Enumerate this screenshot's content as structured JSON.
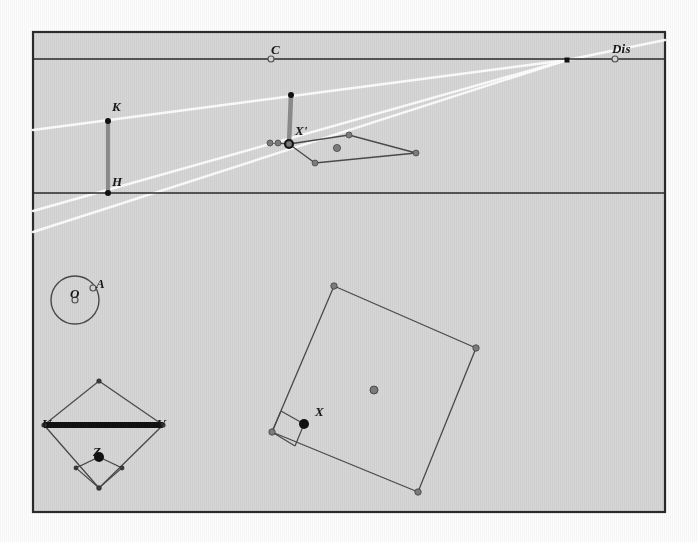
{
  "figure": {
    "kind": "perspective-geometry-construction",
    "background_color": "#d6d6d6",
    "outside_color": "#fdfdfd",
    "frame_color": "#2b2b2b",
    "line_color": "#4a4a4a",
    "construction_line_color": "#ffffff",
    "point_fill_color": "#7d7d7d",
    "solid_point_color": "#111111",
    "bar_color": "#8c8c8c",
    "frame": {
      "x": 33,
      "y": 32,
      "width": 632,
      "height": 480
    },
    "horizon_line": {
      "x1": 33,
      "y1": 59,
      "x2": 665,
      "y2": 59
    },
    "ground_line": {
      "x1": 33,
      "y1": 193,
      "x2": 665,
      "y2": 193
    }
  },
  "labels": [
    {
      "id": "label-C",
      "text": "C",
      "x": 271,
      "y": 43
    },
    {
      "id": "label-Dis",
      "text": "Dis",
      "x": 612,
      "y": 42
    },
    {
      "id": "label-K",
      "text": "K",
      "x": 112,
      "y": 100
    },
    {
      "id": "label-H",
      "text": "H",
      "x": 112,
      "y": 175
    },
    {
      "id": "label-Xp",
      "text": "X'",
      "x": 295,
      "y": 124
    },
    {
      "id": "label-O",
      "text": "O",
      "x": 70,
      "y": 287
    },
    {
      "id": "label-A",
      "text": "A",
      "x": 96,
      "y": 277
    },
    {
      "id": "label-U",
      "text": "U",
      "x": 42,
      "y": 417
    },
    {
      "id": "label-V",
      "text": "V",
      "x": 157,
      "y": 417
    },
    {
      "id": "label-Z",
      "text": "Z",
      "x": 93,
      "y": 445
    },
    {
      "id": "label-X",
      "text": "X",
      "x": 315,
      "y": 405
    }
  ],
  "points": {
    "C": {
      "x": 271,
      "y": 59,
      "style": "hollow"
    },
    "Dis": {
      "x": 615,
      "y": 59,
      "style": "hollow"
    },
    "VP": {
      "x": 567,
      "y": 60,
      "style": "square"
    },
    "K": {
      "x": 108,
      "y": 121,
      "style": "solid-small"
    },
    "H": {
      "x": 108,
      "y": 193,
      "style": "solid-small"
    },
    "Xp": {
      "x": 289,
      "y": 144,
      "style": "solid"
    },
    "Xp_top": {
      "x": 291,
      "y": 95,
      "style": "solid-small"
    },
    "O": {
      "x": 75,
      "y": 300,
      "style": "hollow"
    },
    "A": {
      "x": 93,
      "y": 288,
      "style": "hollow"
    },
    "Z": {
      "x": 99,
      "y": 457,
      "style": "solid"
    },
    "X": {
      "x": 304,
      "y": 424,
      "style": "solid"
    }
  },
  "upper_quad": {
    "name": "perspective-foreshortened-square",
    "vertices": [
      {
        "x": 289,
        "y": 144
      },
      {
        "x": 349,
        "y": 135
      },
      {
        "x": 416,
        "y": 153
      },
      {
        "x": 315,
        "y": 163
      }
    ],
    "center": {
      "x": 337,
      "y": 148
    },
    "extra_points": [
      {
        "x": 270,
        "y": 143
      },
      {
        "x": 278,
        "y": 143
      }
    ]
  },
  "lower_quad": {
    "name": "large-tilted-square",
    "vertices": [
      {
        "x": 334,
        "y": 286
      },
      {
        "x": 476,
        "y": 348
      },
      {
        "x": 418,
        "y": 492
      },
      {
        "x": 272,
        "y": 432
      }
    ],
    "center": {
      "x": 374,
      "y": 390
    },
    "right_angle_marker": [
      {
        "x": 281,
        "y": 411
      },
      {
        "x": 304,
        "y": 424
      },
      {
        "x": 295,
        "y": 446
      }
    ]
  },
  "diamond": {
    "name": "square-root-construction-diamond",
    "vertices": [
      {
        "x": 99,
        "y": 381
      },
      {
        "x": 163,
        "y": 425
      },
      {
        "x": 99,
        "y": 488
      },
      {
        "x": 44,
        "y": 425
      }
    ],
    "bar": {
      "x1": 44,
      "y1": 425,
      "x2": 163,
      "y2": 425
    },
    "inner_diamond": [
      {
        "x": 99,
        "y": 457
      },
      {
        "x": 122,
        "y": 468
      },
      {
        "x": 99,
        "y": 488
      },
      {
        "x": 76,
        "y": 468
      }
    ]
  },
  "circle": {
    "name": "reference-circle",
    "cx": 75,
    "cy": 300,
    "r": 24
  },
  "construction_lines": [
    {
      "id": "vp-to-K-ray",
      "x1": 33,
      "y1": 130,
      "x2": 567,
      "y2": 60
    },
    {
      "id": "vp-to-H-ray",
      "x1": 33,
      "y1": 211,
      "x2": 567,
      "y2": 60
    },
    {
      "id": "vp-lower-ray",
      "x1": 33,
      "y1": 232,
      "x2": 567,
      "y2": 60
    },
    {
      "id": "dis-ray",
      "x1": 567,
      "y1": 60,
      "x2": 665,
      "y2": 40
    }
  ]
}
